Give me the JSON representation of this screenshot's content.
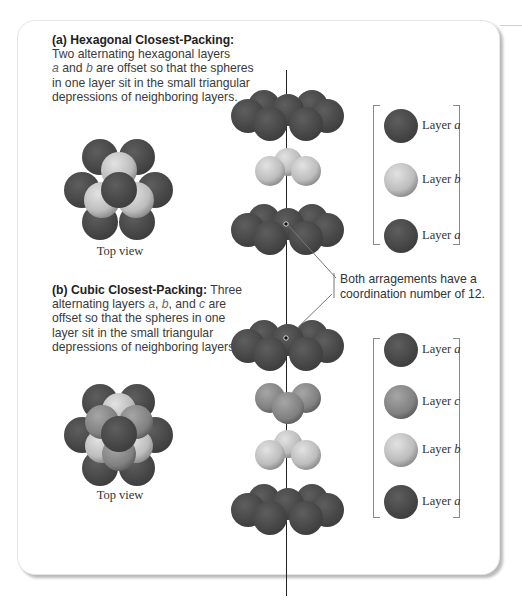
{
  "panel_a": {
    "heading": "(a) Hexagonal Closest-Packing:",
    "body_1": "Two alternating hexagonal layers",
    "var_a": "a",
    "and": " and ",
    "var_b": "b",
    "body_2": " are offset so that the spheres",
    "body_3": "in one layer sit in the small triangular",
    "body_4": "depressions of neighboring layers.",
    "top_view_label": "Top view",
    "layers": [
      {
        "prefix": "Layer ",
        "letter": "a",
        "color": "#4b4b4b"
      },
      {
        "prefix": "Layer ",
        "letter": "b",
        "color": "#c4c4c4"
      },
      {
        "prefix": "Layer ",
        "letter": "a",
        "color": "#4b4b4b"
      }
    ]
  },
  "panel_b": {
    "heading": "(b) Cubic Closest-Packing:",
    "heading_tail": " Three",
    "body_1": "alternating layers ",
    "var_a": "a",
    "sep1": ", ",
    "var_b": "b",
    "sep2": ", and ",
    "var_c": "c",
    "body_1_tail": " are",
    "body_2": "offset so that the spheres in one",
    "body_3": "layer sit in the small triangular",
    "body_4": "depressions of neighboring layers.",
    "top_view_label": "Top view",
    "layers": [
      {
        "prefix": "Layer ",
        "letter": "a",
        "color": "#4b4b4b"
      },
      {
        "prefix": "Layer ",
        "letter": "c",
        "color": "#8a8a8a"
      },
      {
        "prefix": "Layer ",
        "letter": "b",
        "color": "#c4c4c4"
      },
      {
        "prefix": "Layer ",
        "letter": "a",
        "color": "#4b4b4b"
      }
    ]
  },
  "callout": {
    "line_1": "Both arragements have a",
    "line_2": "coordination number of 12."
  },
  "colors": {
    "layer_a": "#4b4b4b",
    "layer_b": "#c4c4c4",
    "layer_c": "#8a8a8a"
  }
}
